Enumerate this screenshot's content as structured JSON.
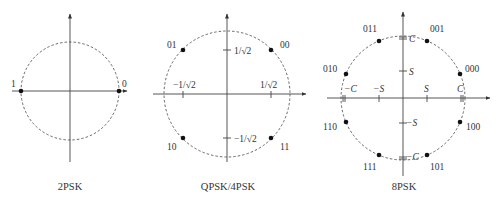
{
  "figure": {
    "panels": [
      {
        "id": "2psk",
        "caption": "2PSK",
        "points": [
          {
            "label": "1",
            "angle_deg": 180
          },
          {
            "label": "0",
            "angle_deg": 0
          }
        ],
        "ticks": []
      },
      {
        "id": "qpsk",
        "caption": "QPSK/4PSK",
        "points": [
          {
            "label": "00",
            "angle_deg": 45
          },
          {
            "label": "01",
            "angle_deg": 135
          },
          {
            "label": "10",
            "angle_deg": 225
          },
          {
            "label": "11",
            "angle_deg": 315
          }
        ],
        "ticks": {
          "y_pos": "1/√2",
          "y_neg": "−1/√2",
          "x_pos": "1/√2",
          "x_neg": "−1/√2"
        }
      },
      {
        "id": "8psk",
        "caption": "8PSK",
        "points": [
          {
            "label": "000",
            "angle_deg": 22.5
          },
          {
            "label": "001",
            "angle_deg": 67.5
          },
          {
            "label": "011",
            "angle_deg": 112.5
          },
          {
            "label": "010",
            "angle_deg": 157.5
          },
          {
            "label": "110",
            "angle_deg": 202.5
          },
          {
            "label": "111",
            "angle_deg": 247.5
          },
          {
            "label": "101",
            "angle_deg": 292.5
          },
          {
            "label": "100",
            "angle_deg": 337.5
          }
        ],
        "ticks": {
          "y_c": "C",
          "y_s": "S",
          "y_neg_s": "−S",
          "y_neg_c": "−C",
          "x_neg_c": "−C",
          "x_neg_s": "−S",
          "x_s": "S",
          "x_c": "C"
        }
      }
    ],
    "colors": {
      "stroke": "#333333",
      "point": "#111111",
      "background": "#ffffff"
    }
  }
}
